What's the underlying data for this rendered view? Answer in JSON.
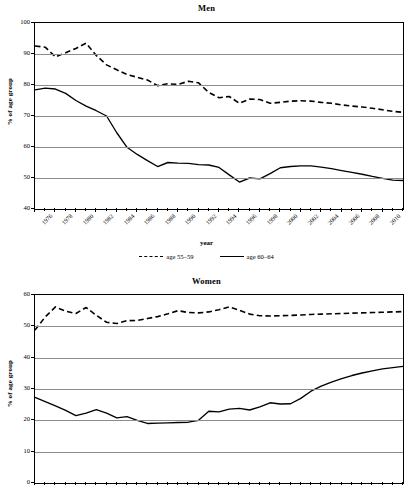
{
  "document": {
    "top_fragment": ""
  },
  "charts": [
    {
      "id": "men",
      "title": "Men",
      "xlabel": "year",
      "ylabel": "% of age group",
      "legend": [
        {
          "label": "age 55–59",
          "style": "dashed"
        },
        {
          "label": "age 60–64",
          "style": "solid"
        }
      ]
    },
    {
      "id": "women",
      "title": "Women",
      "xlabel": "",
      "ylabel": "% of age group",
      "legend": []
    }
  ],
  "chart_data": [
    {
      "type": "line",
      "title": "Men",
      "xlabel": "year",
      "ylabel": "% of age group",
      "ylim": [
        40,
        100
      ],
      "yticks": [
        40,
        50,
        60,
        70,
        80,
        90,
        100
      ],
      "xlim": [
        1976,
        2012
      ],
      "xticks": [
        1976,
        1978,
        1980,
        1982,
        1984,
        1986,
        1988,
        1990,
        1992,
        1994,
        1996,
        1998,
        2000,
        2002,
        2004,
        2006,
        2008,
        2010
      ],
      "grid": "horizontal",
      "legend_position": "below",
      "x": [
        1976,
        1977,
        1978,
        1979,
        1980,
        1981,
        1982,
        1983,
        1984,
        1985,
        1986,
        1987,
        1988,
        1989,
        1990,
        1991,
        1992,
        1993,
        1994,
        1995,
        1996,
        1997,
        1998,
        1999,
        2000,
        2001,
        2002,
        2003,
        2004,
        2005,
        2006,
        2007,
        2008,
        2009,
        2010,
        2011,
        2012
      ],
      "series": [
        {
          "name": "age 55–59",
          "style": "dashed",
          "values": [
            92.6,
            92.2,
            89.1,
            90.4,
            91.8,
            93.5,
            89.5,
            86.5,
            84.9,
            83.4,
            82.5,
            81.6,
            79.8,
            80.4,
            80.2,
            81.2,
            80.7,
            77.6,
            75.9,
            76.3,
            74.1,
            75.5,
            75.3,
            74.1,
            74.4,
            74.8,
            74.9,
            74.8,
            74.4,
            74.1,
            73.6,
            73.2,
            72.9,
            72.5,
            72.0,
            71.5,
            71.2
          ]
        },
        {
          "name": "age 60–64",
          "style": "solid",
          "values": [
            78.4,
            79.0,
            78.7,
            77.3,
            75.0,
            73.2,
            71.7,
            70.0,
            64.6,
            59.9,
            57.6,
            55.6,
            53.7,
            55.0,
            54.8,
            54.7,
            54.3,
            54.2,
            53.4,
            51.0,
            48.7,
            50.0,
            49.7,
            51.4,
            53.3,
            53.7,
            53.9,
            53.9,
            53.5,
            53.0,
            52.4,
            51.8,
            51.2,
            50.5,
            49.9,
            49.3,
            49.2
          ]
        }
      ]
    },
    {
      "type": "line",
      "title": "Women",
      "xlabel": "",
      "ylabel": "% of age group",
      "ylim": [
        0,
        60
      ],
      "yticks": [
        0,
        10,
        20,
        30,
        40,
        50,
        60
      ],
      "xlim": [
        1976,
        2012
      ],
      "grid": "horizontal",
      "legend_position": "none",
      "x": [
        1976,
        1977,
        1978,
        1979,
        1980,
        1981,
        1982,
        1983,
        1984,
        1985,
        1986,
        1987,
        1988,
        1989,
        1990,
        1991,
        1992,
        1993,
        1994,
        1995,
        1996,
        1997,
        1998,
        1999,
        2000,
        2001,
        2002,
        2003,
        2004,
        2005,
        2006,
        2007,
        2008,
        2009,
        2010,
        2011,
        2012
      ],
      "series": [
        {
          "name": "age 55–59",
          "style": "dashed",
          "values": [
            48.8,
            53.0,
            56.2,
            54.8,
            54.1,
            56.0,
            53.5,
            51.3,
            50.9,
            51.8,
            51.9,
            52.5,
            53.1,
            54.0,
            55.0,
            54.4,
            54.3,
            54.6,
            55.3,
            56.2,
            55.1,
            53.9,
            53.4,
            53.3,
            53.4,
            53.5,
            53.6,
            53.8,
            53.9,
            54.0,
            54.1,
            54.2,
            54.3,
            54.4,
            54.5,
            54.6,
            54.7
          ]
        },
        {
          "name": "age 60–64",
          "style": "solid",
          "values": [
            27.3,
            26.0,
            24.6,
            23.2,
            21.5,
            22.3,
            23.4,
            22.3,
            20.8,
            21.2,
            20.0,
            19.0,
            19.1,
            19.2,
            19.3,
            19.4,
            20.0,
            22.9,
            22.7,
            23.6,
            23.8,
            23.3,
            24.3,
            25.6,
            25.2,
            25.3,
            27.0,
            29.3,
            30.9,
            32.2,
            33.3,
            34.3,
            35.1,
            35.8,
            36.4,
            36.8,
            37.2
          ]
        }
      ]
    }
  ]
}
